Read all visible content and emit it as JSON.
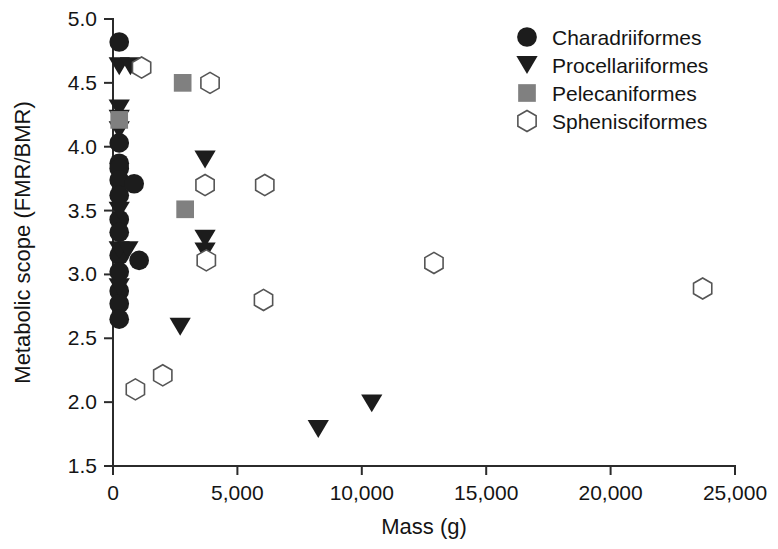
{
  "chart_data": {
    "type": "scatter",
    "title": "",
    "xlabel": "Mass (g)",
    "ylabel": "Metabolic scope (FMR/BMR)",
    "xlim": [
      0,
      25000
    ],
    "ylim": [
      1.5,
      5.0
    ],
    "xticks": [
      0,
      5000,
      10000,
      15000,
      20000,
      25000
    ],
    "xticklabels": [
      "0",
      "5,000",
      "10,000",
      "15,000",
      "20,000",
      "25,000"
    ],
    "yticks": [
      1.5,
      2.0,
      2.5,
      3.0,
      3.5,
      4.0,
      4.5,
      5.0
    ],
    "yticklabels": [
      "1.5",
      "2.0",
      "2.5",
      "3.0",
      "3.5",
      "4.0",
      "4.5",
      "5.0"
    ],
    "grid": false,
    "legend_position": "top-right",
    "series": [
      {
        "name": "Charadriiformes",
        "marker": "filled-circle",
        "color": "#1c1c1c",
        "points": [
          [
            250,
            4.82
          ],
          [
            250,
            4.03
          ],
          [
            250,
            3.87
          ],
          [
            250,
            3.83
          ],
          [
            250,
            3.74
          ],
          [
            250,
            3.62
          ],
          [
            250,
            3.43
          ],
          [
            250,
            3.33
          ],
          [
            250,
            3.15
          ],
          [
            250,
            3.02
          ],
          [
            250,
            2.87
          ],
          [
            250,
            2.77
          ],
          [
            250,
            2.65
          ],
          [
            850,
            3.71
          ],
          [
            1050,
            3.11
          ]
        ]
      },
      {
        "name": "Procellariiformes",
        "marker": "filled-triangle-down",
        "color": "#1c1c1c",
        "points": [
          [
            250,
            4.63
          ],
          [
            700,
            4.63
          ],
          [
            250,
            4.3
          ],
          [
            250,
            4.22
          ],
          [
            250,
            4.13
          ],
          [
            250,
            3.5
          ],
          [
            250,
            3.19
          ],
          [
            600,
            3.19
          ],
          [
            250,
            2.9
          ],
          [
            3700,
            3.9
          ],
          [
            3700,
            3.28
          ],
          [
            3700,
            3.18
          ],
          [
            2700,
            2.59
          ],
          [
            8250,
            1.79
          ],
          [
            10400,
            1.99
          ]
        ]
      },
      {
        "name": "Pelecaniformes",
        "marker": "filled-square",
        "color": "#808080",
        "points": [
          [
            250,
            4.21
          ],
          [
            2800,
            4.5
          ],
          [
            2900,
            3.51
          ]
        ]
      },
      {
        "name": "Sphenisciformes",
        "marker": "open-hexagon",
        "color": "#ffffff",
        "points": [
          [
            1150,
            4.62
          ],
          [
            3900,
            4.5
          ],
          [
            3700,
            3.7
          ],
          [
            6100,
            3.7
          ],
          [
            3750,
            3.11
          ],
          [
            6050,
            2.8
          ],
          [
            12900,
            3.09
          ],
          [
            23700,
            2.89
          ],
          [
            2000,
            2.21
          ],
          [
            900,
            2.1
          ]
        ]
      }
    ]
  },
  "legend": {
    "entries": [
      {
        "label": "Charadriiformes",
        "marker": "filled-circle"
      },
      {
        "label": "Procellariiformes",
        "marker": "filled-triangle-down"
      },
      {
        "label": "Pelecaniformes",
        "marker": "filled-square"
      },
      {
        "label": "Sphenisciformes",
        "marker": "open-hexagon"
      }
    ]
  },
  "colors": {
    "ink": "#1c1c1c",
    "gray_marker": "#808080",
    "open_marker_stroke": "#555555",
    "axis": "#2b2b2b",
    "background": "#ffffff"
  }
}
